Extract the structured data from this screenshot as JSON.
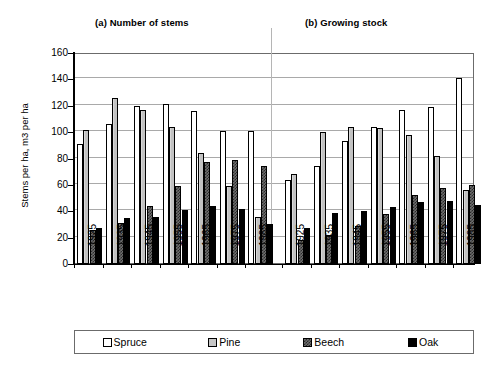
{
  "chart_data": {
    "type": "bar",
    "title": "",
    "panels": [
      {
        "id": "a",
        "title": "(a) Number of stems",
        "categories": [
          "1925",
          "1935",
          "1945",
          "1955",
          "1965",
          "1975",
          "1985"
        ],
        "series": [
          {
            "name": "Spruce",
            "values": [
              91,
              106,
              120,
              121,
              116,
              101,
              101
            ]
          },
          {
            "name": "Pine",
            "values": [
              102,
              126,
              117,
              104,
              84,
              59,
              36
            ]
          },
          {
            "name": "Beech",
            "values": [
              26,
              31,
              44,
              59,
              77,
              79,
              74
            ]
          },
          {
            "name": "Oak",
            "values": [
              27,
              35,
              36,
              41,
              44,
              42,
              30
            ]
          }
        ]
      },
      {
        "id": "b",
        "title": "(b) Growing stock",
        "categories": [
          "1925",
          "1935",
          "1945",
          "1955",
          "1965",
          "1975",
          "1985"
        ],
        "series": [
          {
            "name": "Spruce",
            "values": [
              64,
              74,
              93,
              104,
              117,
              119,
              141
            ]
          },
          {
            "name": "Pine",
            "values": [
              68,
              100,
              104,
              103,
              98,
              82,
              56
            ]
          },
          {
            "name": "Beech",
            "values": [
              18,
              22,
              29,
              38,
              52,
              58,
              60
            ]
          },
          {
            "name": "Oak",
            "values": [
              27,
              39,
              40,
              43,
              47,
              48,
              45
            ]
          }
        ]
      }
    ],
    "ylabel": "Stems per ha, m3 per ha",
    "xlabel": "",
    "ylim": [
      0,
      160
    ],
    "yticks": [
      0,
      20,
      40,
      60,
      80,
      100,
      120,
      140,
      160
    ],
    "grid": true,
    "legend": {
      "position": "bottom",
      "entries": [
        {
          "label": "Spruce",
          "color": "#ffffff",
          "pattern": "solid-white"
        },
        {
          "label": "Pine",
          "color": "#c6c6c6",
          "pattern": "light-gray"
        },
        {
          "label": "Beech",
          "color": "#6e6e6e",
          "pattern": "checker"
        },
        {
          "label": "Oak",
          "color": "#000000",
          "pattern": "solid-black"
        }
      ]
    }
  },
  "axis": {
    "y_label_main": "Stems per ha, m",
    "y_label_sup": "3",
    "y_label_tail": " per ha"
  }
}
